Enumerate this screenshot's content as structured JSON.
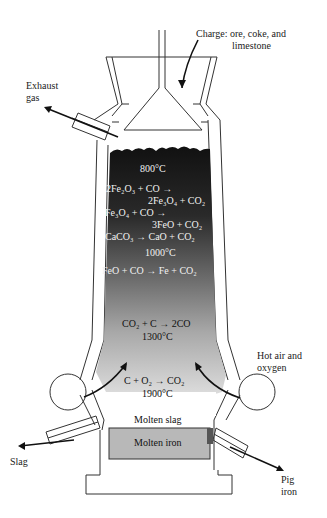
{
  "diagram": {
    "labels": {
      "charge_line1": "Charge: ore, coke, and",
      "charge_line2": "limestone",
      "exhaust_line1": "Exhaust",
      "exhaust_line2": "gas",
      "hot_air_line1": "Hot air and",
      "hot_air_line2": "oxygen",
      "slag": "Slag",
      "pig_line1": "Pig",
      "pig_line2": "iron",
      "molten_slag": "Molten slag",
      "molten_iron": "Molten iron"
    },
    "zones": {
      "t800": "800°C",
      "t1000": "1000°C",
      "t1300": "1300°C",
      "t1900": "1900°C"
    },
    "reactions": [
      {
        "lhs": "2Fe₂O₃ + CO →",
        "rhs": "2Fe₃O₄ + CO₂"
      },
      {
        "lhs": "Fe₃O₄ + CO →",
        "rhs": "3FeO + CO₂"
      },
      {
        "full": "CaCO₃ → CaO + CO₂"
      },
      {
        "full": "FeO + CO → Fe + CO₂"
      },
      {
        "full": "CO₂ + C → 2CO"
      },
      {
        "full": "C + O₂ → CO₂"
      }
    ],
    "colors": {
      "top_fill": "#141414",
      "mid_fill": "#6e6e6e",
      "bottom_fill": "#d6d6d6",
      "iron_fill": "#b4b4b4",
      "outline": "#333333"
    }
  }
}
